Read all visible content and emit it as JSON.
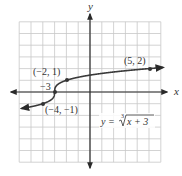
{
  "chart_data": {
    "type": "line",
    "title": "",
    "function": "y = ∛(x + 3)",
    "xlabel": "x",
    "ylabel": "y",
    "xlim": [
      -6,
      6
    ],
    "ylim": [
      -6,
      6
    ],
    "grid": true,
    "grid_step": 1,
    "series": [
      {
        "name": "y = ∛(x + 3)",
        "points": [
          {
            "x": -4,
            "y": -1
          },
          {
            "x": -3,
            "y": 0
          },
          {
            "x": -2,
            "y": 1
          },
          {
            "x": 5,
            "y": 2
          }
        ]
      }
    ],
    "annotations": [
      {
        "text": "(−2, 1)",
        "x": -2,
        "y": 1
      },
      {
        "text": "−3",
        "x": -3,
        "y": 0
      },
      {
        "text": "(−4, −1)",
        "x": -4,
        "y": -1
      },
      {
        "text": "(5, 2)",
        "x": 5,
        "y": 2
      }
    ],
    "equation_label": {
      "lhs": "y",
      "eq": "=",
      "index": "3",
      "radicand": "x + 3"
    }
  },
  "labels": {
    "x_axis": "x",
    "y_axis": "y",
    "pt_neg2_1": "(−2, 1)",
    "pt_neg3": "−3",
    "pt_neg4_neg1": "(−4, −1)",
    "pt_5_2": "(5, 2)",
    "eq_lhs": "y =",
    "eq_index": "3",
    "eq_radicand": "x + 3"
  }
}
